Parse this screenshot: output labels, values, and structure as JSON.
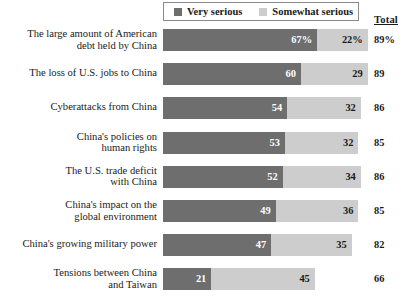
{
  "chart_data": {
    "type": "bar",
    "orientation": "horizontal",
    "stacked": true,
    "title": "",
    "subtitle": "",
    "xlabel": "",
    "ylabel": "",
    "xlim": [
      0,
      100
    ],
    "grid": false,
    "legend_position": "top",
    "total_column_header": "Total",
    "series": [
      {
        "name": "Very serious",
        "color": "#6e6e6e",
        "values": [
          67,
          60,
          54,
          53,
          52,
          49,
          47,
          21
        ],
        "labels": [
          "67%",
          "60",
          "54",
          "53",
          "52",
          "49",
          "47",
          "21"
        ]
      },
      {
        "name": "Somewhat serious",
        "color": "#cdcdcd",
        "values": [
          22,
          29,
          32,
          32,
          34,
          36,
          35,
          45
        ],
        "labels": [
          "22%",
          "29",
          "32",
          "32",
          "34",
          "36",
          "35",
          "45"
        ]
      }
    ],
    "categories": [
      "The large amount of American debt held by China",
      "The loss of U.S. jobs to China",
      "Cyberattacks from China",
      "China's policies on human rights",
      "The U.S. trade deficit with China",
      "China's impact on the global environment",
      "China's growing military power",
      "Tensions between China and Taiwan"
    ],
    "totals": [
      89,
      89,
      86,
      85,
      86,
      85,
      82,
      66
    ],
    "total_labels": [
      "89%",
      "89",
      "86",
      "85",
      "86",
      "85",
      "82",
      "66"
    ]
  },
  "legend": {
    "items": [
      {
        "label": "Very serious",
        "color": "#6e6e6e"
      },
      {
        "label": "Somewhat serious",
        "color": "#cdcdcd"
      }
    ]
  },
  "columns": {
    "total_header": "Total"
  },
  "rows": [
    {
      "label_line1": "The large amount of American",
      "label_line2": "debt held by China",
      "very": 67,
      "very_label": "67%",
      "somewhat": 22,
      "somewhat_label": "22%",
      "total_label": "89%"
    },
    {
      "label_line1": "The loss of U.S. jobs to China",
      "label_line2": "",
      "very": 60,
      "very_label": "60",
      "somewhat": 29,
      "somewhat_label": "29",
      "total_label": "89"
    },
    {
      "label_line1": "Cyberattacks from China",
      "label_line2": "",
      "very": 54,
      "very_label": "54",
      "somewhat": 32,
      "somewhat_label": "32",
      "total_label": "86"
    },
    {
      "label_line1": "China's policies on",
      "label_line2": "human rights",
      "very": 53,
      "very_label": "53",
      "somewhat": 32,
      "somewhat_label": "32",
      "total_label": "85"
    },
    {
      "label_line1": "The U.S. trade deficit",
      "label_line2": "with China",
      "very": 52,
      "very_label": "52",
      "somewhat": 34,
      "somewhat_label": "34",
      "total_label": "86"
    },
    {
      "label_line1": "China's impact on the",
      "label_line2": "global environment",
      "very": 49,
      "very_label": "49",
      "somewhat": 36,
      "somewhat_label": "36",
      "total_label": "85"
    },
    {
      "label_line1": "China's growing military power",
      "label_line2": "",
      "very": 47,
      "very_label": "47",
      "somewhat": 35,
      "somewhat_label": "35",
      "total_label": "82"
    },
    {
      "label_line1": "Tensions between China",
      "label_line2": "and Taiwan",
      "very": 21,
      "very_label": "21",
      "somewhat": 45,
      "somewhat_label": "45",
      "total_label": "66"
    }
  ],
  "layout": {
    "bar_origin_x": 163,
    "px_per_unit": 2.3,
    "first_row_y": 29,
    "row_pitch": 34.2,
    "bar_height": 22
  }
}
